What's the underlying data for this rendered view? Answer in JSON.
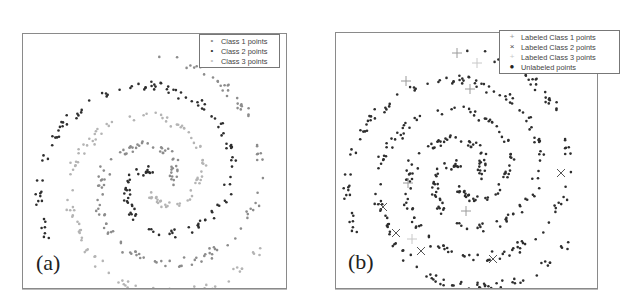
{
  "chart_data": [
    {
      "type": "scatter",
      "panel_label": "(a)",
      "title": "",
      "xlabel": "",
      "ylabel": "",
      "grid": false,
      "axes_ticks": false,
      "legend_position": "upper right",
      "legend": [
        {
          "label": "Class 1 points",
          "marker": "dot",
          "color": "#8c8c8c"
        },
        {
          "label": "Class 2 points",
          "marker": "dot",
          "color": "#2e2e2e"
        },
        {
          "label": "Class 3 points",
          "marker": "dot",
          "color": "#b4b4b4"
        }
      ],
      "description": "Three interleaved spiral arms (three-class spiral dataset), each class colored differently",
      "series": [
        {
          "name": "Class 1 points",
          "arm_phase_deg": 0,
          "color": "#8c8c8c",
          "n_points": 150
        },
        {
          "name": "Class 2 points",
          "arm_phase_deg": 120,
          "color": "#2e2e2e",
          "n_points": 150
        },
        {
          "name": "Class 3 points",
          "arm_phase_deg": 240,
          "color": "#b4b4b4",
          "n_points": 150
        }
      ]
    },
    {
      "type": "scatter",
      "panel_label": "(b)",
      "title": "",
      "xlabel": "",
      "ylabel": "",
      "grid": false,
      "axes_ticks": false,
      "legend_position": "upper right",
      "legend": [
        {
          "label": "Labeled Class 1 points",
          "marker": "+",
          "color": "#9a9a9a"
        },
        {
          "label": "Labeled Class 2 points",
          "marker": "x",
          "color": "#555555"
        },
        {
          "label": "Labeled Class 3 points",
          "marker": "+",
          "color": "#c8c8c8"
        },
        {
          "label": "Unlabeled points",
          "marker": "dot",
          "color": "#2e2e2e"
        }
      ],
      "description": "Same three-arm spiral with nearly all points unlabeled (dark dots) and a few labeled points per class",
      "series": [
        {
          "name": "Unlabeled points",
          "color": "#2e2e2e",
          "n_points": 450
        },
        {
          "name": "Labeled Class 1 points",
          "marker": "+",
          "color": "#9a9a9a",
          "points_px": [
            [
              121,
              20
            ],
            [
              134,
              56
            ],
            [
              70,
              48
            ],
            [
              130,
              178
            ],
            [
              72,
              150
            ]
          ]
        },
        {
          "name": "Labeled Class 2 points",
          "marker": "x",
          "color": "#555555",
          "points_px": [
            [
              225,
              140
            ],
            [
              47,
              174
            ],
            [
              60,
              200
            ],
            [
              85,
              218
            ],
            [
              157,
              226
            ]
          ]
        },
        {
          "name": "Labeled Class 3 points",
          "marker": "+",
          "color": "#c8c8c8",
          "points_px": [
            [
              141,
              30
            ],
            [
              76,
              206
            ]
          ]
        }
      ]
    }
  ],
  "panels": {
    "a": {
      "label": "(a)",
      "legend": [
        "Class 1 points",
        "Class 2 points",
        "Class 3 points"
      ]
    },
    "b": {
      "label": "(b)",
      "legend": [
        "Labeled Class 1 points",
        "Labeled Class 2 points",
        "Labeled Class 3 points",
        "Unlabeled points"
      ]
    }
  },
  "spiral": {
    "center_a": [
      135,
      148
    ],
    "center_b": [
      130,
      143
    ],
    "turns": 1.25,
    "r_min": 12,
    "r_max": 125
  },
  "colors": {
    "class1": "#8c8c8c",
    "class2": "#2e2e2e",
    "class3": "#b4b4b4",
    "unlabeled": "#2e2e2e",
    "frame": "#8a8a8a"
  }
}
